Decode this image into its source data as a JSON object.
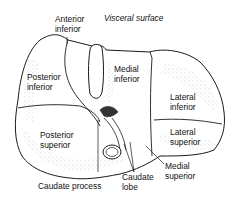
{
  "diagram": {
    "title": "Visceral surface",
    "segments": [
      {
        "id": "anterior-inferior",
        "label": "Anterior\ninferior"
      },
      {
        "id": "posterior-inferior",
        "label": "Posterior\ninferior"
      },
      {
        "id": "medial-inferior",
        "label": "Medial\ninferior"
      },
      {
        "id": "lateral-inferior",
        "label": "Lateral\ninferior"
      },
      {
        "id": "lateral-superior",
        "label": "Lateral\nsuperior"
      },
      {
        "id": "posterior-superior",
        "label": "Posterior\nsuperior"
      },
      {
        "id": "medial-superior",
        "label": "Medial\nsuperior"
      }
    ],
    "callouts": [
      {
        "id": "caudate-process",
        "label": "Caudate process"
      },
      {
        "id": "caudate-lobe",
        "label": "Caudate\nlobe"
      }
    ],
    "colors": {
      "line": "#1a1a1a",
      "stipple": "#9a9a9a",
      "background": "#ffffff"
    }
  }
}
